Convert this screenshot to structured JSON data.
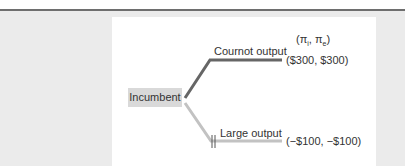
{
  "game_tree": {
    "node": {
      "label": "Incumbent"
    },
    "payoff_header": "(πi, πe)",
    "payoff_header_parts": {
      "open": "(π",
      "sub1": "i",
      "mid": ", π",
      "sub2": "e",
      "close": ")"
    },
    "branches": [
      {
        "label": "Cournot output",
        "payoff": "($300, $300)",
        "color": "#666666",
        "pruned": false
      },
      {
        "label": "Large output",
        "payoff": "(−$100, −$100)",
        "color": "#c2c2c2",
        "pruned": true
      }
    ]
  },
  "colors": {
    "panel": "#ebebeb",
    "node_bg": "#d9d9d9",
    "top_rule": "#6e6e6e"
  }
}
